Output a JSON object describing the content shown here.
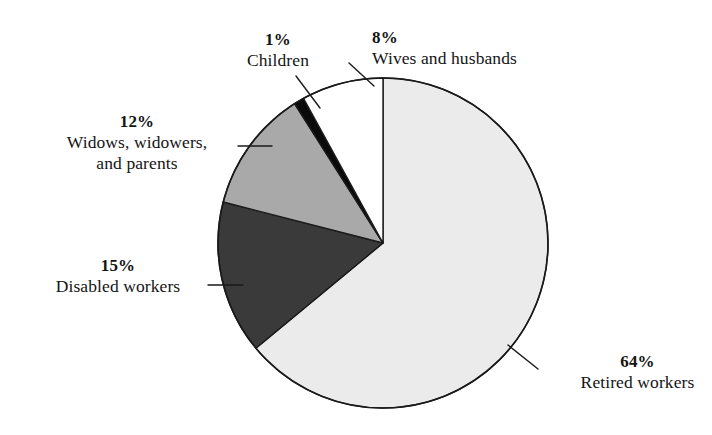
{
  "chart_data": {
    "type": "pie",
    "title": "",
    "subtitle": "",
    "xlabel": "",
    "ylabel": "",
    "legend_position": "none",
    "grid": false,
    "units": "percent",
    "total": 100,
    "start_angle_deg": 0,
    "direction": "clockwise",
    "categories": [
      "Retired workers",
      "Disabled workers",
      "Widows, widowers, and parents",
      "Children",
      "Wives and husbands"
    ],
    "values": [
      64,
      15,
      12,
      1,
      8
    ],
    "slices": [
      {
        "id": "retired",
        "label": "Retired workers",
        "label_line1": "Retired workers",
        "label_line2": "",
        "value": 64,
        "percent_text": "64%",
        "color": "#ebebeb",
        "start_deg": 0.0,
        "end_deg": 230.4,
        "leader": true
      },
      {
        "id": "disabled",
        "label": "Disabled workers",
        "label_line1": "Disabled workers",
        "label_line2": "",
        "value": 15,
        "percent_text": "15%",
        "color": "#3a3a3a",
        "start_deg": 230.4,
        "end_deg": 284.4,
        "leader": true
      },
      {
        "id": "widows",
        "label": "Widows, widowers, and parents",
        "label_line1": "Widows, widowers,",
        "label_line2": "and parents",
        "value": 12,
        "percent_text": "12%",
        "color": "#a9a9a9",
        "start_deg": 284.4,
        "end_deg": 327.6,
        "leader": true
      },
      {
        "id": "children",
        "label": "Children",
        "label_line1": "Children",
        "label_line2": "",
        "value": 1,
        "percent_text": "1%",
        "color": "#0a0a0a",
        "start_deg": 327.6,
        "end_deg": 331.2,
        "leader": true
      },
      {
        "id": "wives",
        "label": "Wives and husbands",
        "label_line1": "Wives and husbands",
        "label_line2": "",
        "value": 8,
        "percent_text": "8%",
        "color": "#ffffff",
        "start_deg": 331.2,
        "end_deg": 360.0,
        "leader": true
      }
    ],
    "geometry": {
      "center_x": 383,
      "center_y": 243,
      "radius": 165,
      "outline_color": "#1a1a1a",
      "background": "#ffffff"
    }
  }
}
